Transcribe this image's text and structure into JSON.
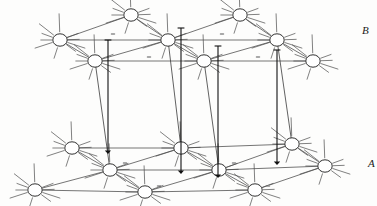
{
  "figure": {
    "type": "crystal-lattice-diagram",
    "width": 377,
    "height": 206,
    "background_color": "#fdfdfc"
  },
  "labels": {
    "upper_layer": "B",
    "lower_layer": "A"
  },
  "style": {
    "atom_fill": "#ffffff",
    "atom_stroke": "#1a1a1a",
    "atom_stroke_width": 0.9,
    "atom_rx": 7.2,
    "atom_ry": 6.2,
    "bond_color": "#3a3a3a",
    "bond_width": 0.7,
    "stub_color": "#4a4a4a",
    "stub_width": 0.7,
    "pillar_color": "#3a3a3a",
    "pillar_width": 0.8,
    "arrow_color": "#111111",
    "arrow_width": 1.1,
    "dash_color": "#a8a8a8",
    "dash_width": 4.5,
    "dash_height": 2.0
  },
  "layers": {
    "upper": {
      "name": "B",
      "atoms": [
        {
          "id": "b1",
          "x": 131,
          "y": 15
        },
        {
          "id": "b2",
          "x": 240,
          "y": 15
        },
        {
          "id": "b3",
          "x": 60,
          "y": 40
        },
        {
          "id": "b4",
          "x": 168,
          "y": 40
        },
        {
          "id": "b5",
          "x": 277,
          "y": 40
        },
        {
          "id": "b6",
          "x": 95,
          "y": 61
        },
        {
          "id": "b7",
          "x": 204,
          "y": 61
        },
        {
          "id": "b8",
          "x": 313,
          "y": 61
        }
      ],
      "bonds": [
        [
          "b3",
          "b1"
        ],
        [
          "b1",
          "b4"
        ],
        [
          "b4",
          "b2"
        ],
        [
          "b2",
          "b5"
        ],
        [
          "b3",
          "b6"
        ],
        [
          "b6",
          "b4"
        ],
        [
          "b4",
          "b7"
        ],
        [
          "b7",
          "b5"
        ],
        [
          "b5",
          "b8"
        ],
        [
          "b3",
          "b4"
        ],
        [
          "b4",
          "b5"
        ],
        [
          "b6",
          "b7"
        ],
        [
          "b7",
          "b8"
        ]
      ],
      "gray_dashes": [
        {
          "x": 113,
          "y": 34
        },
        {
          "x": 222,
          "y": 34
        },
        {
          "x": 149,
          "y": 57
        },
        {
          "x": 258,
          "y": 57
        }
      ]
    },
    "lower": {
      "name": "A",
      "atoms": [
        {
          "id": "a1",
          "x": 72,
          "y": 148
        },
        {
          "id": "a2",
          "x": 181,
          "y": 148
        },
        {
          "id": "a3",
          "x": 292,
          "y": 144
        },
        {
          "id": "a4",
          "x": 110,
          "y": 170
        },
        {
          "id": "a5",
          "x": 219,
          "y": 170
        },
        {
          "id": "a6",
          "x": 325,
          "y": 166
        },
        {
          "id": "a7",
          "x": 35,
          "y": 190
        },
        {
          "id": "a8",
          "x": 145,
          "y": 192
        },
        {
          "id": "a9",
          "x": 255,
          "y": 190
        }
      ],
      "bonds": [
        [
          "a1",
          "a4"
        ],
        [
          "a4",
          "a2"
        ],
        [
          "a2",
          "a5"
        ],
        [
          "a5",
          "a3"
        ],
        [
          "a3",
          "a6"
        ],
        [
          "a7",
          "a4"
        ],
        [
          "a4",
          "a8"
        ],
        [
          "a8",
          "a5"
        ],
        [
          "a5",
          "a9"
        ],
        [
          "a9",
          "a6"
        ],
        [
          "a1",
          "a2"
        ],
        [
          "a2",
          "a3"
        ],
        [
          "a4",
          "a5"
        ],
        [
          "a5",
          "a6"
        ],
        [
          "a7",
          "a8"
        ],
        [
          "a8",
          "a9"
        ]
      ],
      "gray_dashes": [
        {
          "x": 125,
          "y": 163
        },
        {
          "x": 234,
          "y": 163
        },
        {
          "x": 159,
          "y": 186
        },
        {
          "x": 268,
          "y": 186
        }
      ]
    }
  },
  "pillars": [
    {
      "x_top": 95,
      "y_top": 61,
      "x_bot": 110,
      "y_bot": 170
    },
    {
      "x_top": 204,
      "y_top": 61,
      "x_bot": 219,
      "y_bot": 170
    },
    {
      "x_top": 168,
      "y_top": 40,
      "x_bot": 181,
      "y_bot": 148
    },
    {
      "x_top": 277,
      "y_top": 40,
      "x_bot": 292,
      "y_bot": 144
    }
  ],
  "spin_arrows": [
    {
      "id": "s1",
      "x": 108,
      "y_top": 40,
      "y_bot": 152,
      "layer": "B-to-A"
    },
    {
      "id": "s2",
      "x": 181,
      "y_top": 28,
      "y_bot": 172,
      "layer": "B-to-A"
    },
    {
      "id": "s3",
      "x": 218,
      "y_top": 46,
      "y_bot": 176,
      "layer": "B-to-A"
    },
    {
      "id": "s4",
      "x": 277,
      "y_top": 50,
      "y_bot": 163,
      "layer": "B-to-A"
    }
  ],
  "stub_lengths": {
    "short": 11,
    "long": 18
  },
  "stub_angles_deg": [
    162,
    180,
    200,
    218,
    340,
    358,
    18,
    36,
    108,
    268
  ]
}
